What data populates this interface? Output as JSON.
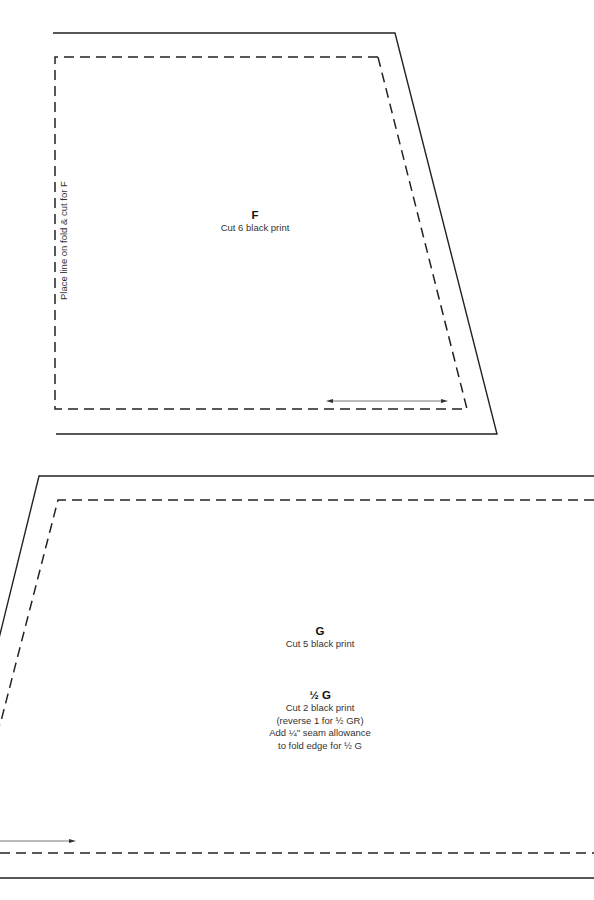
{
  "piece_f": {
    "letter": "F",
    "instruction": "Cut 6 black print",
    "fold_note": "Place line on fold & cut for F"
  },
  "piece_g": {
    "letter": "G",
    "instruction": "Cut 5 black print"
  },
  "piece_half_g": {
    "title": "½ G",
    "lines": [
      "Cut 2 black print",
      "(reverse 1 for ½ GR)",
      "Add ¼\" seam allowance",
      "to fold edge for ½ G"
    ]
  },
  "colors": {
    "line": "#222222",
    "grainline": "#555555",
    "background": "#ffffff"
  }
}
